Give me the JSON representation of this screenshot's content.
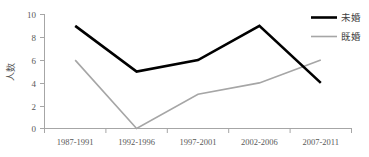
{
  "chart_data": {
    "type": "line",
    "title": "",
    "xlabel": "",
    "ylabel": "人数",
    "categories": [
      "1987-1991",
      "1992-1996",
      "1997-2001",
      "2002-2006",
      "2007-2011"
    ],
    "series": [
      {
        "name": "未婚",
        "values": [
          9,
          5,
          6,
          9,
          4
        ],
        "color": "#000000",
        "width": 2.6
      },
      {
        "name": "既婚",
        "values": [
          6,
          0,
          3,
          4,
          6
        ],
        "color": "#a6a6a6",
        "width": 1.6
      }
    ],
    "ylim": [
      0,
      10
    ],
    "yticks": [
      0,
      2,
      4,
      6,
      8,
      10
    ],
    "ytick_labels": [
      "0",
      "2",
      "4",
      "6",
      "8",
      "10"
    ],
    "grid": false,
    "legend_position": "top-right"
  },
  "axes": {
    "y_title": "人数",
    "y_ticks": [
      {
        "label": "10"
      },
      {
        "label": "8"
      },
      {
        "label": "6"
      },
      {
        "label": "4"
      },
      {
        "label": "2"
      },
      {
        "label": "0"
      }
    ],
    "x_ticks": [
      {
        "label": "1987-1991"
      },
      {
        "label": "1992-1996"
      },
      {
        "label": "1997-2001"
      },
      {
        "label": "2002-2006"
      },
      {
        "label": "2007-2011"
      }
    ]
  },
  "legend": {
    "entries": [
      {
        "label": "未婚",
        "color": "#000000"
      },
      {
        "label": "既婚",
        "color": "#a6a6a6"
      }
    ]
  },
  "style": {
    "axis_color": "#a6a6a6",
    "text_color": "#595959",
    "background": "#ffffff",
    "series_unmarried_color": "#000000",
    "series_married_color": "#a6a6a6"
  }
}
